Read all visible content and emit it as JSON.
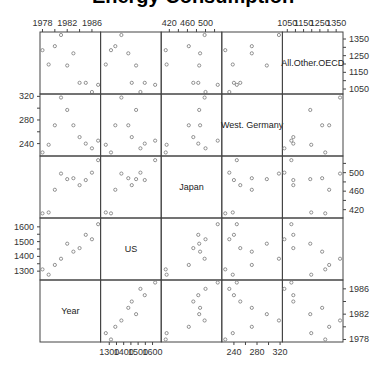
{
  "chart_data": {
    "type": "scatter",
    "subtype": "scatterplot-matrix",
    "title": "Energy Consumption",
    "variables": [
      "Year",
      "US",
      "Japan",
      "West. Germany",
      "All.Other.OECD"
    ],
    "diagonal_labels": [
      "All.Other.OECD",
      "West. Germany",
      "Japan",
      "US",
      "Year"
    ],
    "data": {
      "Year": [
        1978,
        1979,
        1980,
        1981,
        1982,
        1983,
        1984,
        1985,
        1986,
        1987
      ],
      "US": [
        1312,
        1276,
        1342,
        1384,
        1486,
        1432,
        1456,
        1546,
        1516,
        1618
      ],
      "Japan": [
        412,
        414,
        463,
        498,
        486,
        488,
        473,
        484,
        500,
        527
      ],
      "West. Germany": [
        225,
        238,
        271,
        318,
        297,
        271,
        251,
        240,
        232,
        245
      ],
      "All.Other.OECD": [
        1283,
        1197,
        1307,
        1374,
        1191,
        1264,
        1087,
        1087,
        1032,
        1075
      ]
    },
    "axes": {
      "Year": {
        "ticks": [
          1978,
          1980,
          1982,
          1984,
          1986
        ],
        "labels": [
          "1978",
          "1982",
          "1986"
        ],
        "range": [
          1977.6,
          1987.4
        ]
      },
      "US": {
        "ticks": [
          1300,
          1350,
          1400,
          1450,
          1500,
          1550,
          1600
        ],
        "labels": [
          "1300",
          "1400",
          "1500",
          "1600"
        ],
        "range": [
          1240,
          1660
        ]
      },
      "Japan": {
        "ticks": [
          420,
          440,
          460,
          480,
          500,
          520
        ],
        "labels": [
          "420",
          "460",
          "500"
        ],
        "range": [
          402,
          536
        ]
      },
      "West. Germany": {
        "ticks": [
          240,
          260,
          280,
          300,
          320
        ],
        "labels": [
          "240",
          "280",
          "320"
        ],
        "range": [
          219,
          324
        ]
      },
      "All.Other.OECD": {
        "ticks": [
          1050,
          1100,
          1150,
          1200,
          1250,
          1300,
          1350
        ],
        "labels": [
          "1050",
          "1150",
          "1250",
          "1350"
        ],
        "range": [
          1020,
          1392
        ]
      }
    },
    "axis_positions": {
      "top": [
        "Year",
        "Japan",
        "All.Other.OECD"
      ],
      "bottom": [
        "US",
        "West. Germany"
      ],
      "left": [
        "West. Germany",
        "US"
      ],
      "right": [
        "All.Other.OECD",
        "Japan",
        "Year"
      ]
    },
    "grid": false,
    "legend": null
  },
  "columns_order": [
    "Year",
    "US",
    "Japan",
    "West. Germany",
    "All.Other.OECD"
  ],
  "rows_order": [
    "All.Other.OECD",
    "West. Germany",
    "Japan",
    "US",
    "Year"
  ],
  "colors": {
    "frame": "#444444",
    "point": "#777777",
    "text": "#333333"
  }
}
